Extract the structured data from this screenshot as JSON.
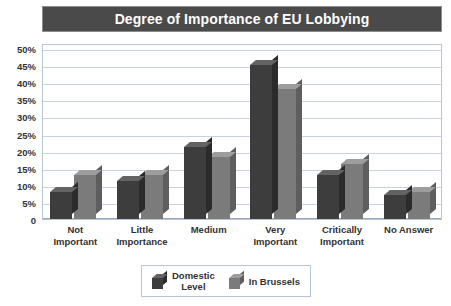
{
  "chart_data": {
    "type": "bar",
    "title": "Degree of Importance of EU Lobbying",
    "xlabel": "",
    "ylabel": "",
    "ylim": [
      0,
      50
    ],
    "ytick_labels": [
      "50%",
      "45%",
      "40%",
      "35%",
      "30%",
      "25%",
      "20%",
      "15%",
      "10%",
      "5%",
      "0"
    ],
    "ytick_values": [
      50,
      45,
      40,
      35,
      30,
      25,
      20,
      15,
      10,
      5,
      0
    ],
    "grid": true,
    "legend_position": "bottom",
    "categories": [
      "Not\nImportant",
      "Little\nImportance",
      "Medium",
      "Very\nImportant",
      "Critically\nImportant",
      "No Answer"
    ],
    "series": [
      {
        "name": "Domestic\nLevel",
        "color": "#3d3d3d",
        "values": [
          8,
          11,
          21,
          45,
          13,
          7
        ]
      },
      {
        "name": "In Brussels",
        "color": "#7b7b7b",
        "values": [
          13,
          13,
          18,
          38,
          16,
          8
        ]
      }
    ]
  }
}
